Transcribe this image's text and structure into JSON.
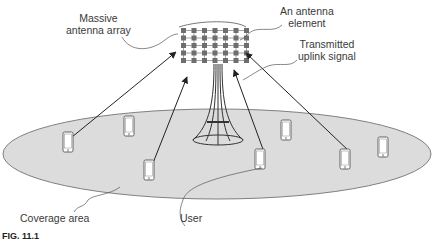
{
  "labels": {
    "massive_array": [
      "Massive",
      "antenna array"
    ],
    "antenna_element": [
      "An antenna",
      "element"
    ],
    "uplink_signal": [
      "Transmitted",
      "uplink signal"
    ],
    "coverage_area": "Coverage area",
    "user": "User"
  },
  "figure_caption": "FIG. 11.1",
  "colors": {
    "coverage_fill": "#dcdcdc",
    "coverage_stroke": "#808080",
    "line": "#333333",
    "antenna_element": "#6e6e6e",
    "text": "#3a3a3a"
  },
  "array": {
    "columns": 7,
    "rows": 5
  },
  "users": [
    {
      "x": 68,
      "y": 142
    },
    {
      "x": 129,
      "y": 126
    },
    {
      "x": 149,
      "y": 170
    },
    {
      "x": 260,
      "y": 159
    },
    {
      "x": 286,
      "y": 130
    },
    {
      "x": 345,
      "y": 159
    },
    {
      "x": 383,
      "y": 147
    }
  ]
}
